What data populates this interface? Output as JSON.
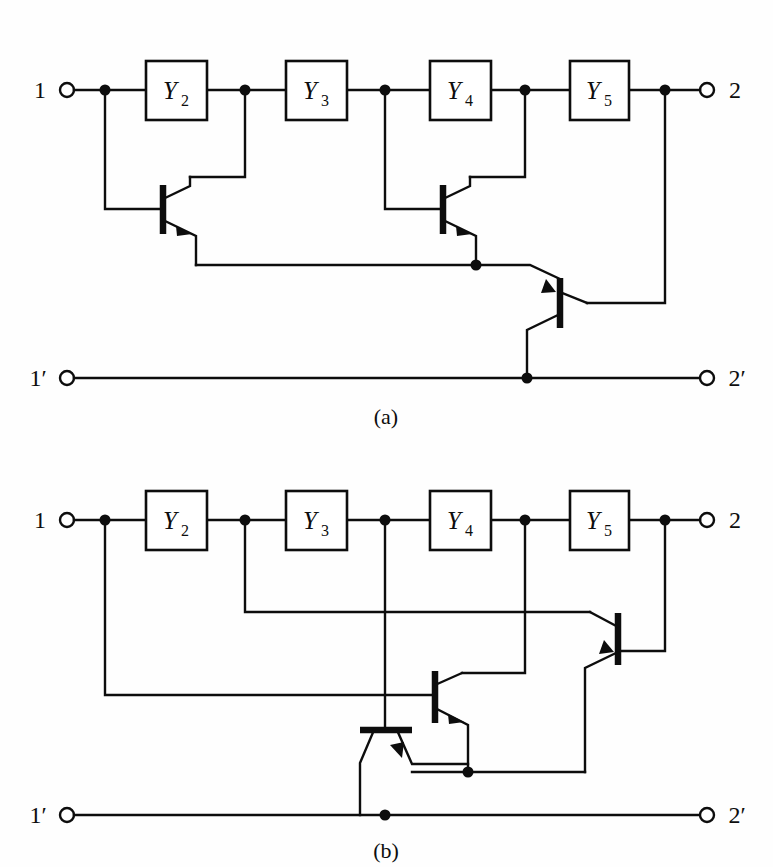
{
  "figure": {
    "background_color": "#fefefe",
    "line_color": "#0d0d0d",
    "width": 773,
    "height": 867
  },
  "diagrams": [
    {
      "id": "a",
      "caption": "(a)",
      "terminals": {
        "input_top": "1",
        "input_bottom": "1′",
        "output_top": "2",
        "output_bottom": "2′"
      },
      "blocks": [
        {
          "label": "Y",
          "subscript": "2",
          "full": "Y2"
        },
        {
          "label": "Y",
          "subscript": "3",
          "full": "Y3"
        },
        {
          "label": "Y",
          "subscript": "4",
          "full": "Y4"
        },
        {
          "label": "Y",
          "subscript": "5",
          "full": "Y5"
        }
      ],
      "transistor_count": 3,
      "transistors": [
        {
          "name": "Q1",
          "type": "npn",
          "orientation": "base-left"
        },
        {
          "name": "Q2",
          "type": "npn",
          "orientation": "base-left"
        },
        {
          "name": "Q3",
          "type": "npn",
          "orientation": "base-right"
        }
      ],
      "node_count": 7
    },
    {
      "id": "b",
      "caption": "(b)",
      "terminals": {
        "input_top": "1",
        "input_bottom": "1′",
        "output_top": "2",
        "output_bottom": "2′"
      },
      "blocks": [
        {
          "label": "Y",
          "subscript": "2",
          "full": "Y2"
        },
        {
          "label": "Y",
          "subscript": "3",
          "full": "Y3"
        },
        {
          "label": "Y",
          "subscript": "4",
          "full": "Y4"
        },
        {
          "label": "Y",
          "subscript": "5",
          "full": "Y5"
        }
      ],
      "transistor_count": 3,
      "transistors": [
        {
          "name": "Q1",
          "type": "npn",
          "orientation": "base-top-horizontal"
        },
        {
          "name": "Q2",
          "type": "npn",
          "orientation": "base-left"
        },
        {
          "name": "Q3",
          "type": "npn",
          "orientation": "base-left"
        }
      ],
      "node_count": 7
    }
  ]
}
